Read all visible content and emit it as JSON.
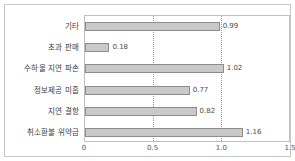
{
  "chart_data": {
    "type": "bar",
    "orientation": "horizontal",
    "title": "",
    "xlabel": "",
    "ylabel": "",
    "xlim": [
      0,
      1.5
    ],
    "xticks": [
      "0",
      "0.5",
      "1.0",
      "1.5"
    ],
    "xtick_values": [
      0,
      0.5,
      1.0,
      1.5
    ],
    "gridlines": [
      0.5,
      1.0
    ],
    "grid": true,
    "legend": "none",
    "categories": [
      "기타",
      "초과 판매",
      "수하물 지연 파손",
      "정보제공 미흡",
      "지연 결항",
      "취소환불 위약금"
    ],
    "values": [
      0.99,
      0.18,
      1.02,
      0.77,
      0.82,
      1.16
    ],
    "data_labels": [
      "0.99",
      "0.18",
      "1.02",
      "0.77",
      "0.82",
      "1.16"
    ],
    "bar_fill_color": "#c9c9c9",
    "bar_border_color": "#8d8d8d",
    "frame_color": "#c8c8c8",
    "axis_color": "#bfbfbf"
  }
}
